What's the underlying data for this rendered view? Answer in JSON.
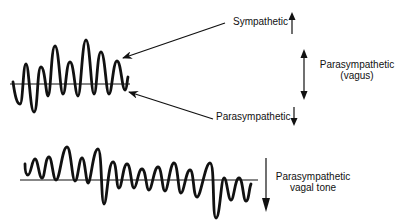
{
  "labels": {
    "sympathetic": "Sympathetic",
    "parasympathetic": "Parasympathetic",
    "parasympathetic_vagus_line1": "Parasympathetic",
    "parasympathetic_vagus_line2": "(vagus)",
    "vagal_tone_line1": "Parasympathetic",
    "vagal_tone_line2": "vagal tone"
  },
  "icons": {
    "sympathetic_arrow": "arrow-up",
    "parasympathetic_arrow": "arrow-down",
    "vagus_arrow": "arrow-up-down",
    "vagal_tone_arrow": "arrow-down"
  },
  "colors": {
    "stroke": "#111111",
    "background": "#ffffff"
  }
}
